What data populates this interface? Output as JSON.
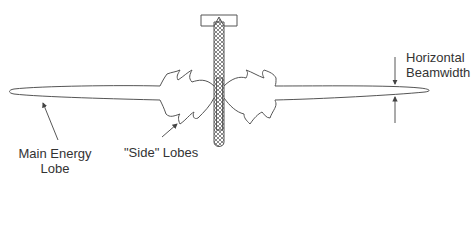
{
  "diagram": {
    "colors": {
      "stroke": "#555555",
      "text": "#333333",
      "background": "#ffffff"
    },
    "labels": {
      "main_lobe_line1": "Main Energy",
      "main_lobe_line2": "Lobe",
      "side_lobes": "\"Side\" Lobes",
      "beamwidth_line1": "Horizontal",
      "beamwidth_line2": "Beamwidth"
    },
    "components": [
      {
        "id": "antenna",
        "description": "Vertical antenna rod mounted to a horizontal bracket, cross-hatched"
      },
      {
        "id": "main-lobe-left",
        "description": "Long narrow main energy lobe extending left"
      },
      {
        "id": "main-lobe-right",
        "description": "Long narrow main energy lobe extending right"
      },
      {
        "id": "side-lobes",
        "description": "Jagged side lobes near the antenna on both sides"
      },
      {
        "id": "beamwidth-arrows",
        "description": "Two opposing arrows indicating horizontal beamwidth"
      }
    ]
  }
}
